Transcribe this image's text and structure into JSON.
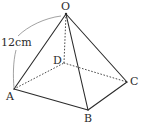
{
  "figure": {
    "kind": "geometry-diagram",
    "shape_name": "square pyramid O-ABCD",
    "background_color": "#ffffff",
    "stroke_color": "#2b2b2b",
    "hidden_stroke_color": "#4a4a4a",
    "leader_color": "#8a8a8a",
    "labels": {
      "apex": "O",
      "front_left": "A",
      "front_bottom": "B",
      "right": "C",
      "back_hidden": "D",
      "dimension": "12cm"
    },
    "points": {
      "O": {
        "x": 66,
        "y": 14
      },
      "A": {
        "x": 14,
        "y": 89
      },
      "B": {
        "x": 88,
        "y": 110
      },
      "C": {
        "x": 127,
        "y": 82
      },
      "D": {
        "x": 64,
        "y": 63
      }
    },
    "edges": [
      {
        "name": "OA",
        "from": "O",
        "to": "A",
        "style": "solid",
        "hidden": false
      },
      {
        "name": "OB",
        "from": "O",
        "to": "B",
        "style": "solid",
        "hidden": false
      },
      {
        "name": "OC",
        "from": "O",
        "to": "C",
        "style": "solid",
        "hidden": false
      },
      {
        "name": "AB",
        "from": "A",
        "to": "B",
        "style": "solid",
        "hidden": false
      },
      {
        "name": "BC",
        "from": "B",
        "to": "C",
        "style": "solid",
        "hidden": false
      },
      {
        "name": "OD",
        "from": "O",
        "to": "D",
        "style": "dotted",
        "hidden": true
      },
      {
        "name": "AD",
        "from": "A",
        "to": "D",
        "style": "dotted",
        "hidden": true
      },
      {
        "name": "DC",
        "from": "D",
        "to": "C",
        "style": "dotted",
        "hidden": true
      }
    ],
    "leader": {
      "name": "dimension-leader",
      "annotates_edge": "OA",
      "upper_path": "M 61 16 C 45 18 28 26 18 36",
      "lower_path": "M 16 50 C 13 62 13 76 14 88"
    }
  }
}
